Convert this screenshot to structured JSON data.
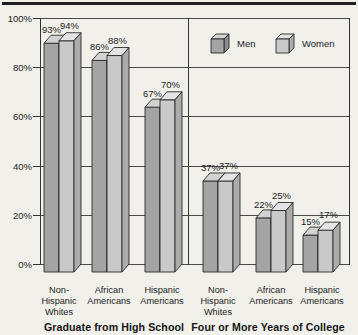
{
  "colors": {
    "background": "#f2f0eb",
    "top_rule": "#1f1f1f",
    "grid": "#4a4a4a",
    "axis": "#333333",
    "bar_outline": "#2b2b2b",
    "text": "#1c1c1c"
  },
  "chart_data": {
    "type": "bar",
    "style": "3d-grouped",
    "title": "",
    "xlabel": "",
    "ylabel": "",
    "categories": [
      "Non-Hispanic Whites",
      "African Americans",
      "Hispanic Americans",
      "Non-Hispanic Whites",
      "African Americans",
      "Hispanic Americans"
    ],
    "category_label_lines": [
      [
        "Non-",
        "Hispanic",
        "Whites"
      ],
      [
        "African",
        "Americans"
      ],
      [
        "Hispanic",
        "Americans"
      ],
      [
        "Non-",
        "Hispanic",
        "Whites"
      ],
      [
        "African",
        "Americans"
      ],
      [
        "Hispanic",
        "Americans"
      ]
    ],
    "series": [
      {
        "name": "Men",
        "values": [
          93,
          86,
          67,
          37,
          22,
          15
        ],
        "color_front": "#a4a4a4",
        "color_top": "#d2d2d2",
        "color_side": "#8c8c8c"
      },
      {
        "name": "Women",
        "values": [
          94,
          88,
          70,
          37,
          25,
          17
        ],
        "color_front": "#c9c9c9",
        "color_top": "#e4e4e4",
        "color_side": "#ababab"
      }
    ],
    "data_labels": [
      "93%",
      "94%",
      "86%",
      "88%",
      "67%",
      "70%",
      "37%",
      "37%",
      "22%",
      "25%",
      "15%",
      "17%"
    ],
    "data_label_format": "{v}%",
    "group_labels": [
      "Graduate from High School",
      "Four or More Years of College"
    ],
    "categories_per_group": 3,
    "y_axis": {
      "min": 0,
      "max": 100,
      "ticks": [
        0,
        20,
        40,
        60,
        80,
        100
      ],
      "tick_labels": [
        "0%",
        "20%",
        "40%",
        "60%",
        "80%",
        "100%"
      ]
    },
    "grid": true,
    "legend_position": "top-right"
  }
}
